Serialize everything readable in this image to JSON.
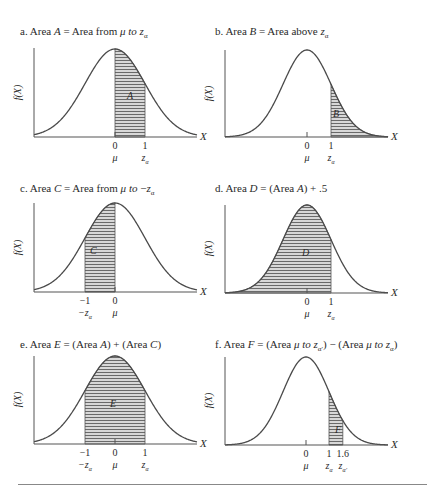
{
  "figure": {
    "panels": [
      {
        "id": "a",
        "title_prefix": "a. Area ",
        "title_var": "A",
        "title_rest": " = Area from ",
        "title_mu": "μ",
        "title_to": " to ",
        "title_z": "z",
        "title_sub": "α",
        "title_text": "a. Area A = Area from μ to zα",
        "area_label": "A",
        "shade_from": 0,
        "shade_to": 1,
        "ticks": [
          {
            "value": "0",
            "symbol": "μ"
          },
          {
            "value": "1",
            "symbol": "zα"
          }
        ]
      },
      {
        "id": "b",
        "title_text": "b. Area B = Area above zα",
        "area_label": "B",
        "shade_from": 1,
        "shade_to": "inf",
        "ticks": [
          {
            "value": "0",
            "symbol": "μ"
          },
          {
            "value": "1",
            "symbol": "zα"
          }
        ]
      },
      {
        "id": "c",
        "title_text": "c. Area C = Area from μ to −zα",
        "area_label": "C",
        "shade_from": -1,
        "shade_to": 0,
        "ticks": [
          {
            "value": "−1",
            "symbol": "−zα"
          },
          {
            "value": "0",
            "symbol": "μ"
          }
        ]
      },
      {
        "id": "d",
        "title_text": "d. Area D = (Area A) + .5",
        "area_label": "D",
        "shade_from": "-inf",
        "shade_to": 1,
        "ticks": [
          {
            "value": "0",
            "symbol": "μ"
          },
          {
            "value": "1",
            "symbol": "zα"
          }
        ]
      },
      {
        "id": "e",
        "title_text": "e. Area E = (Area A) + (Area C)",
        "area_label": "E",
        "shade_from": -1,
        "shade_to": 1,
        "ticks": [
          {
            "value": "−1",
            "symbol": "−zα"
          },
          {
            "value": "0",
            "symbol": "μ"
          },
          {
            "value": "1",
            "symbol": "zα"
          }
        ]
      },
      {
        "id": "f",
        "title_text": "f. Area F = (Area μ to zα′) − (Area μ to zα)",
        "area_label": "F",
        "shade_from": 1,
        "shade_to": 1.6,
        "ticks": [
          {
            "value": "0",
            "symbol": "μ"
          },
          {
            "value": "1",
            "symbol": "zα"
          },
          {
            "value": "1.6",
            "symbol": "zα′"
          }
        ]
      }
    ],
    "y_axis_label": "f(X)",
    "x_axis_label": "X"
  },
  "chart_data": {
    "type": "area",
    "xlabel": "X",
    "ylabel": "f(X)",
    "grid": false,
    "charts": [
      {
        "panel": "a",
        "title": "a. Area A = Area from μ to zα",
        "shaded_region": [
          0,
          1
        ],
        "label": "A",
        "tick_labels": [
          "0 (μ)",
          "1 (zα)"
        ]
      },
      {
        "panel": "b",
        "title": "b. Area B = Area above zα",
        "shaded_region": [
          1,
          "inf"
        ],
        "label": "B",
        "tick_labels": [
          "0 (μ)",
          "1 (zα)"
        ]
      },
      {
        "panel": "c",
        "title": "c. Area C = Area from μ to −zα",
        "shaded_region": [
          -1,
          0
        ],
        "label": "C",
        "tick_labels": [
          "−1 (−zα)",
          "0 (μ)"
        ]
      },
      {
        "panel": "d",
        "title": "d. Area D = (Area A) + .5",
        "shaded_region": [
          "-inf",
          1
        ],
        "label": "D",
        "tick_labels": [
          "0 (μ)",
          "1 (zα)"
        ]
      },
      {
        "panel": "e",
        "title": "e. Area E = (Area A) + (Area C)",
        "shaded_region": [
          -1,
          1
        ],
        "label": "E",
        "tick_labels": [
          "−1 (−zα)",
          "0 (μ)",
          "1 (zα)"
        ]
      },
      {
        "panel": "f",
        "title": "f. Area F = (Area μ to zα′) − (Area μ to zα)",
        "shaded_region": [
          1,
          1.6
        ],
        "label": "F",
        "tick_labels": [
          "0 (μ)",
          "1 (zα)",
          "1.6 (zα′)"
        ]
      }
    ]
  }
}
